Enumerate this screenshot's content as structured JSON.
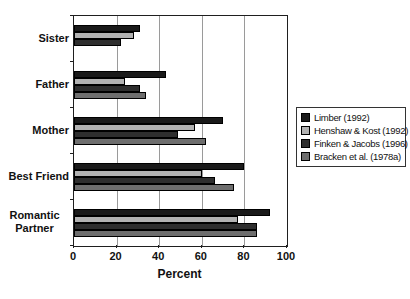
{
  "chart_data": {
    "type": "bar",
    "orientation": "horizontal",
    "title": "",
    "xlabel": "Percent",
    "xlim": [
      0,
      100
    ],
    "xticks": [
      0,
      20,
      40,
      60,
      80,
      100
    ],
    "grid": true,
    "legend_position": "right-outside",
    "categories": [
      "Sister",
      "Father",
      "Mother",
      "Best Friend",
      "Romantic Partner"
    ],
    "series": [
      {
        "name": "Limber (1992)",
        "color": "#1a1a1a",
        "values": [
          31,
          43,
          70,
          80,
          92
        ]
      },
      {
        "name": "Henshaw & Kost (1992)",
        "color": "#b2b2b2",
        "values": [
          28,
          24,
          57,
          60,
          77
        ]
      },
      {
        "name": "Finken & Jacobs (1996)",
        "color": "#2e2e2e",
        "values": [
          22,
          31,
          49,
          66,
          86
        ]
      },
      {
        "name": "Bracken et al. (1978a)",
        "color": "#6e6e6e",
        "values": [
          null,
          34,
          62,
          75,
          86
        ]
      }
    ]
  },
  "styles": {
    "plot_border": "#1f1f1f",
    "gridline": "#9a9a9a",
    "text": "#111111",
    "background": "#ffffff"
  }
}
